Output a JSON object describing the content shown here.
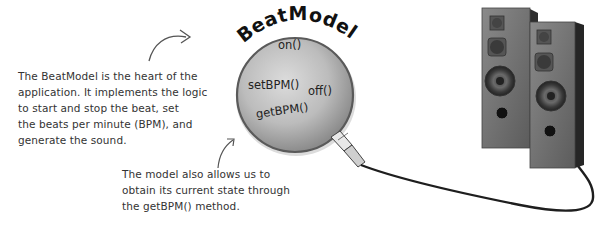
{
  "diagram": {
    "model": {
      "title": "BeatModel",
      "methods": [
        "on()",
        "setBPM()",
        "off()",
        "getBPM()"
      ]
    },
    "annotations": {
      "left": {
        "lines": [
          "The BeatModel is the heart of the",
          "application.  It implements the logic",
          "to start and stop the beat, set",
          "the beats per minute (BPM), and",
          "generate the sound."
        ]
      },
      "bottom": {
        "lines": [
          "The model also allows us to",
          "obtain its current state through",
          "the getBPM() method."
        ]
      }
    },
    "icons": {
      "left_arrow": "curved-arrow-right",
      "bottom_arrow": "curved-arrow-up",
      "speakers": "tower-speakers",
      "cable": "audio-cable"
    },
    "colors": {
      "background": "#ffffff",
      "sphere": "#bdbdbd",
      "sphere_edge": "#6a6a6a",
      "speaker_body": "#5a5a5a",
      "text": "#333333"
    }
  }
}
